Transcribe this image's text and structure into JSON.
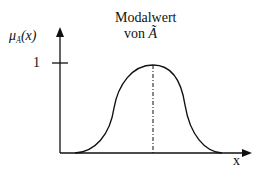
{
  "diagram": {
    "title_line1": "Modalwert",
    "title_line2_prefix": "von",
    "title_line2_symbol": "Ã",
    "y_axis_label_main": "μ",
    "y_axis_label_sub": "Ã",
    "y_axis_label_arg": "(x)",
    "y_tick_label": "1",
    "x_axis_label": "x",
    "curve_type": "bell-shaped fuzzy membership function",
    "modal_line_style": "dash-dot"
  },
  "colors": {
    "line": "#111111",
    "background": "#ffffff"
  }
}
